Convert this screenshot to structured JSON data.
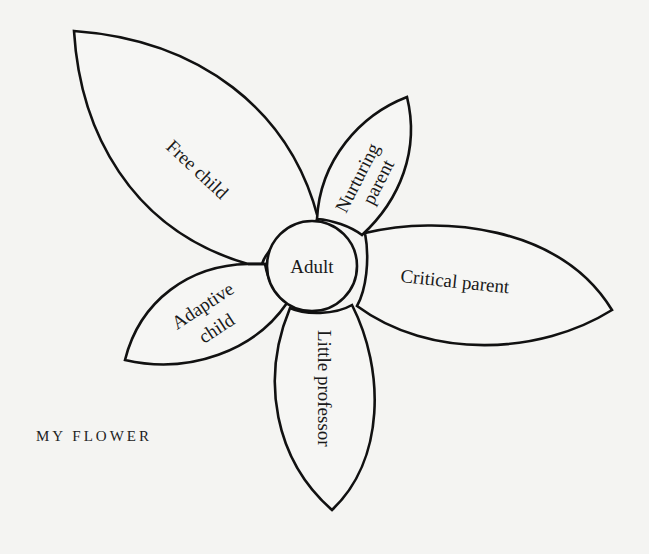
{
  "diagram": {
    "title": "MY FLOWER",
    "type": "flower",
    "center": {
      "label": "Adult"
    },
    "petals": [
      {
        "id": "free-child",
        "label_lines": [
          "Free child"
        ]
      },
      {
        "id": "nurturing-parent",
        "label_lines": [
          "Nurturing",
          "parent"
        ]
      },
      {
        "id": "critical-parent",
        "label_lines": [
          "Critical parent"
        ]
      },
      {
        "id": "little-professor",
        "label_lines": [
          "Little professor"
        ]
      },
      {
        "id": "adaptive-child",
        "label_lines": [
          "Adaptive",
          "child"
        ]
      }
    ],
    "colors": {
      "background": "#f4f4f2",
      "stroke": "#111111",
      "text": "#1a1a1a"
    }
  }
}
